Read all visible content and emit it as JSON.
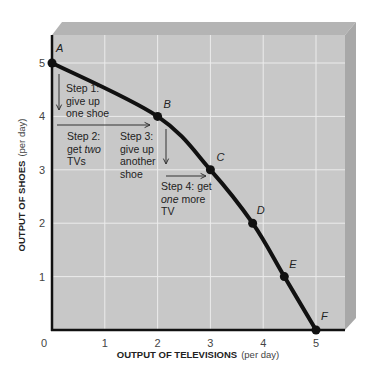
{
  "chart_data": {
    "type": "line",
    "title": "",
    "xlabel": "OUTPUT OF TELEVISIONS",
    "xlabel_unit": "(per day)",
    "ylabel": "OUTPUT OF SHOES",
    "ylabel_unit": "(per day)",
    "xlim": [
      0,
      5.6
    ],
    "ylim": [
      0,
      5.5
    ],
    "x_ticks": [
      "0",
      "1",
      "2",
      "3",
      "4",
      "5"
    ],
    "y_ticks": [
      "1",
      "2",
      "3",
      "4",
      "5"
    ],
    "grid": true,
    "series": [
      {
        "name": "Production possibilities frontier",
        "points": [
          {
            "label": "A",
            "x": 0,
            "y": 5
          },
          {
            "label": "B",
            "x": 2,
            "y": 4
          },
          {
            "label": "C",
            "x": 3,
            "y": 3
          },
          {
            "label": "D",
            "x": 3.8,
            "y": 2
          },
          {
            "label": "E",
            "x": 4.4,
            "y": 1
          },
          {
            "label": "F",
            "x": 5,
            "y": 0
          }
        ]
      }
    ],
    "annotations": [
      {
        "name": "step-1",
        "lines": [
          [
            "Step 1:"
          ],
          [
            "give up"
          ],
          [
            "one shoe"
          ]
        ]
      },
      {
        "name": "step-2",
        "lines": [
          [
            "Step 2:"
          ],
          [
            "get ",
            {
              "i": "two"
            }
          ],
          [
            "TVs"
          ]
        ]
      },
      {
        "name": "step-3",
        "lines": [
          [
            "Step 3:"
          ],
          [
            "give up"
          ],
          [
            "another"
          ],
          [
            "shoe"
          ]
        ]
      },
      {
        "name": "step-4",
        "lines": [
          [
            "Step 4: get"
          ],
          [
            {
              "i": "one"
            },
            " more"
          ],
          [
            "TV"
          ]
        ]
      }
    ],
    "colors": {
      "plot_bg": "#c8c8c8",
      "bevel_top": "#b4b4b4",
      "bevel_side": "#a8a8a8",
      "grid": "#ececec",
      "curve": "#111111"
    }
  }
}
